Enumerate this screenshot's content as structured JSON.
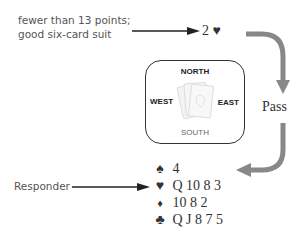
{
  "annotation": {
    "line1": "fewer than 13 points;",
    "line2": "good six-card suit"
  },
  "bid": {
    "level": "2",
    "suit_symbol": "♥",
    "label": "2 ♥"
  },
  "table": {
    "north": "NORTH",
    "south": "SOUTH",
    "east": "EAST",
    "west": "WEST"
  },
  "response": "Pass",
  "responder_label": "Responder",
  "hand": [
    {
      "suit": "spades",
      "symbol": "♠",
      "cards": "4"
    },
    {
      "suit": "hearts",
      "symbol": "♥",
      "cards": "Q 10 8 3"
    },
    {
      "suit": "diamonds",
      "symbol": "♦",
      "cards": "10 8 2"
    },
    {
      "suit": "clubs",
      "symbol": "♣",
      "cards": "Q J 8 7 5"
    }
  ],
  "colors": {
    "arrow_gray": "#888888",
    "text": "#333333",
    "box_border": "#333333"
  }
}
